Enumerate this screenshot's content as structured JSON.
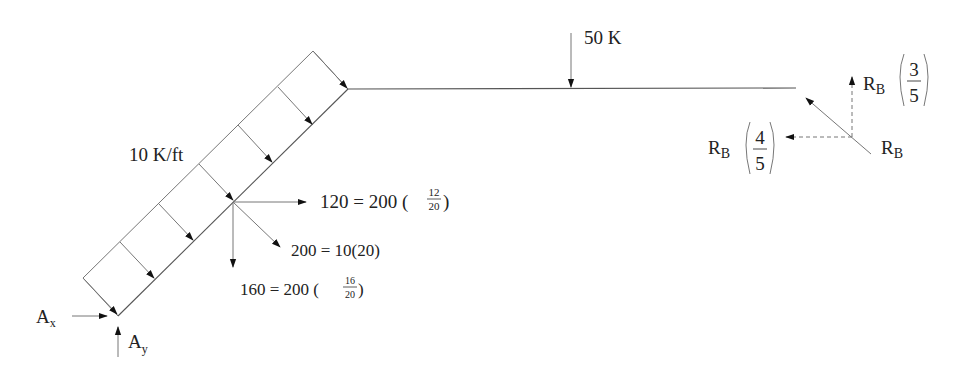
{
  "diagram": {
    "type": "free-body-diagram",
    "labels": {
      "distributed_load": "10 K/ft",
      "point_load": "50 K",
      "horizontal_component": "120 = 200 ",
      "horizontal_frac_num": "12",
      "horizontal_frac_den": "20",
      "resultant": "200 = 10(20)",
      "vertical_component": "160 = 200 ",
      "vertical_frac_num": "16",
      "vertical_frac_den": "20",
      "ax": "A",
      "ax_sub": "x",
      "ay": "A",
      "ay_sub": "y",
      "rb": "R",
      "rb_sub": "B",
      "rb_vertical": "R",
      "rb_vertical_sub": "B",
      "rb_vertical_num": "3",
      "rb_vertical_den": "5",
      "rb_horizontal": "R",
      "rb_horizontal_sub": "B",
      "rb_horizontal_num": "4",
      "rb_horizontal_den": "5"
    },
    "colors": {
      "line": "#555555",
      "text": "#222222",
      "background": "#ffffff"
    }
  }
}
